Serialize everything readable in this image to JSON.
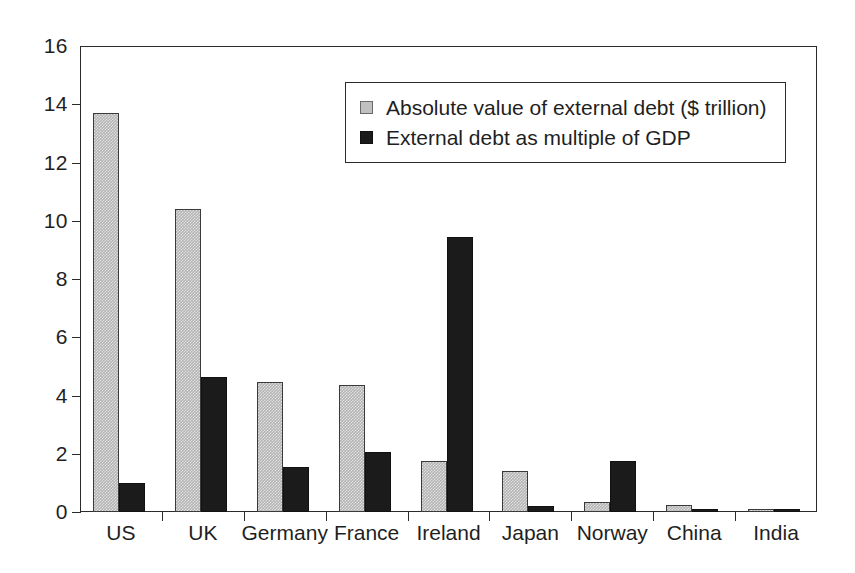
{
  "chart_data": {
    "type": "bar",
    "title": "",
    "subtitle": "",
    "xlabel": "",
    "ylabel": "",
    "grid": false,
    "legend_position": "top-center",
    "ylim": [
      0,
      16
    ],
    "yticks": [
      0,
      2,
      4,
      6,
      8,
      10,
      12,
      14,
      16
    ],
    "ytick_labels": [
      "0",
      "2",
      "4",
      "6",
      "8",
      "10",
      "12",
      "14",
      "16"
    ],
    "categories": [
      "US",
      "UK",
      "Germany",
      "France",
      "Ireland",
      "Japan",
      "Norway",
      "China",
      "India"
    ],
    "series": [
      {
        "name": "Absolute value of external debt ($ trillion)",
        "color": "#b4b4b4",
        "values": [
          13.7,
          10.4,
          4.45,
          4.35,
          1.75,
          1.4,
          0.35,
          0.25,
          0.12
        ]
      },
      {
        "name": "External debt as multiple of GDP",
        "color": "#1b1b1b",
        "values": [
          1.0,
          4.65,
          1.55,
          2.05,
          9.45,
          0.2,
          1.75,
          0.06,
          0.06
        ]
      }
    ],
    "annotations": []
  },
  "legend": {
    "entries": [
      {
        "label": "Absolute value of external debt ($ trillion)",
        "swatch": "light-gray-square"
      },
      {
        "label": "External debt as multiple of GDP",
        "swatch": "black-square"
      }
    ]
  },
  "colors": {
    "series_1_fill": "#b4b4b4",
    "series_2_fill": "#1b1b1b",
    "axis": "#2b2b2b",
    "background": "#ffffff",
    "text": "#1f1f1f"
  }
}
